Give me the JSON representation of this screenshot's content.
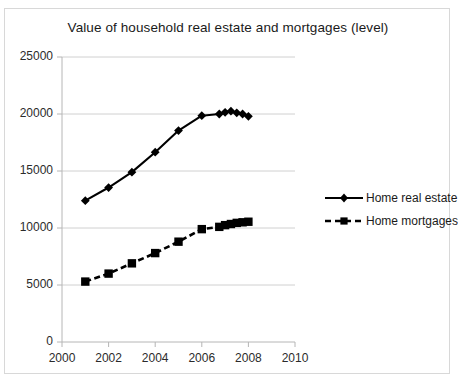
{
  "chart_data": {
    "type": "line",
    "title": "Value of household real estate and mortgages (level)",
    "xlabel": "",
    "ylabel": "",
    "xlim": [
      2000,
      2010
    ],
    "ylim": [
      0,
      25000
    ],
    "xticks": [
      "2000",
      "2002",
      "2004",
      "2006",
      "2008",
      "2010"
    ],
    "yticks": [
      "0",
      "5000",
      "10000",
      "15000",
      "20000",
      "25000"
    ],
    "grid": "horizontal",
    "legend_position": "right",
    "series": [
      {
        "name": "Home real estate",
        "marker": "diamond",
        "line_style": "solid",
        "color": "#000000",
        "x": [
          2001.0,
          2002.0,
          2003.0,
          2004.0,
          2005.0,
          2006.0,
          2006.75,
          2007.0,
          2007.25,
          2007.5,
          2007.75,
          2008.0
        ],
        "values": [
          12400,
          13550,
          14900,
          16650,
          18550,
          19850,
          20000,
          20150,
          20250,
          20100,
          20000,
          19800
        ]
      },
      {
        "name": "Home mortgages",
        "marker": "square",
        "line_style": "dashed",
        "color": "#000000",
        "x": [
          2001.0,
          2002.0,
          2003.0,
          2004.0,
          2005.0,
          2006.0,
          2006.75,
          2007.0,
          2007.25,
          2007.5,
          2007.75,
          2008.0
        ],
        "values": [
          5300,
          6000,
          6900,
          7800,
          8800,
          9900,
          10100,
          10250,
          10350,
          10450,
          10500,
          10550
        ]
      }
    ]
  },
  "legend": {
    "items": [
      {
        "label": "Home real estate"
      },
      {
        "label": "Home mortgages"
      }
    ]
  }
}
